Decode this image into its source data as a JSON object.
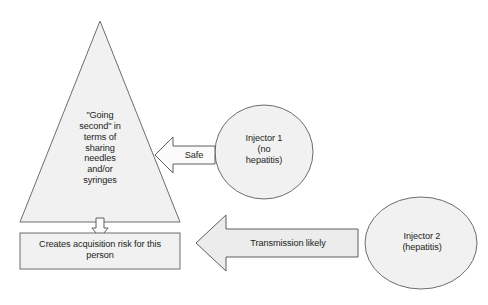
{
  "diagram": {
    "background_color": "#ffffff",
    "shape_fill_color": "#f1f1f1",
    "shape_stroke_color": "#6d6d6d",
    "arrow_fill_color": "#ececec",
    "text_color": "#231f20",
    "nodes": {
      "triangle": {
        "label": "\"Going\nsecond\" in\nterms of\nsharing\nneedles\nand/or\nsyringes",
        "shape": "triangle"
      },
      "outcome_box": {
        "label": "Creates acquisition risk for this\nperson",
        "shape": "rectangle"
      },
      "injector_one": {
        "label": "Injector 1\n(no\nhepatitis)",
        "shape": "ellipse"
      },
      "injector_two": {
        "label": "Injector 2\n(hepatitis)",
        "shape": "ellipse"
      }
    },
    "connectors": {
      "safe_arrow": {
        "label": "Safe",
        "direction": "left",
        "from": "injector_one",
        "to": "triangle"
      },
      "transmission_arrow": {
        "label": "Transmission likely",
        "direction": "left",
        "from": "injector_two",
        "to": "outcome_box"
      },
      "risk_arrow": {
        "label": "",
        "direction": "down",
        "from": "triangle",
        "to": "outcome_box"
      }
    }
  }
}
